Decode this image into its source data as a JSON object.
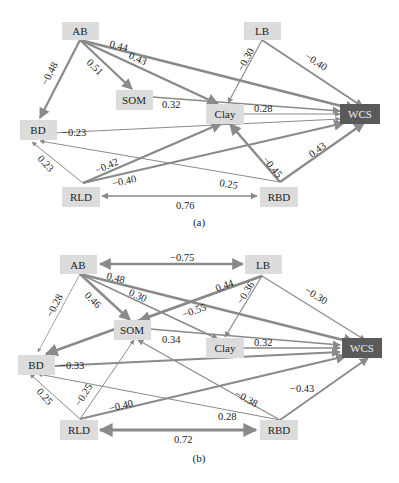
{
  "diagrams": [
    {
      "id": "a",
      "caption": "(a)",
      "nodes": {
        "AB": "AB",
        "LB": "LB",
        "SOM": "SOM",
        "Clay": "Clay",
        "BD": "BD",
        "WCS": "WCS",
        "RLD": "RLD",
        "RBD": "RBD"
      },
      "edges": [
        {
          "from": "AB",
          "to": "WCS",
          "label": "0.44"
        },
        {
          "from": "AB",
          "to": "Clay",
          "label": "0.43"
        },
        {
          "from": "AB",
          "to": "SOM",
          "label": "0.51"
        },
        {
          "from": "AB",
          "to": "BD",
          "label": "-0.48"
        },
        {
          "from": "LB",
          "to": "Clay",
          "label": "-0.30"
        },
        {
          "from": "LB",
          "to": "WCS",
          "label": "-0.40"
        },
        {
          "from": "SOM",
          "to": "WCS",
          "label": "0.32"
        },
        {
          "from": "Clay",
          "to": "WCS",
          "label": "0.28"
        },
        {
          "from": "BD",
          "to": "WCS",
          "label": "-0.23"
        },
        {
          "from": "RLD",
          "to": "BD",
          "label": "0.23"
        },
        {
          "from": "RLD",
          "to": "Clay",
          "label": "-0.42"
        },
        {
          "from": "RLD",
          "to": "WCS",
          "label": "-0.40"
        },
        {
          "from": "RBD",
          "to": "BD",
          "label": "0.25"
        },
        {
          "from": "RBD",
          "to": "Clay",
          "label": "-0.45"
        },
        {
          "from": "RBD",
          "to": "WCS",
          "label": "0.43"
        },
        {
          "from": "RLD",
          "to": "RBD",
          "label": "0.76",
          "bidirectional": true
        }
      ]
    },
    {
      "id": "b",
      "caption": "(b)",
      "nodes": {
        "AB": "AB",
        "LB": "LB",
        "SOM": "SOM",
        "Clay": "Clay",
        "BD": "BD",
        "WCS": "WCS",
        "RLD": "RLD",
        "RBD": "RBD"
      },
      "edges": [
        {
          "from": "AB",
          "to": "LB",
          "label": "-0.75",
          "bidirectional": true
        },
        {
          "from": "AB",
          "to": "WCS",
          "label": "0.48"
        },
        {
          "from": "AB",
          "to": "Clay",
          "label": "0.30"
        },
        {
          "from": "AB",
          "to": "SOM",
          "label": "0.46"
        },
        {
          "from": "AB",
          "to": "BD",
          "label": "-0.28"
        },
        {
          "from": "LB",
          "to": "BD",
          "label": "0.44"
        },
        {
          "from": "LB",
          "to": "SOM",
          "label": "-0.55"
        },
        {
          "from": "LB",
          "to": "Clay",
          "label": "-0.36"
        },
        {
          "from": "LB",
          "to": "WCS",
          "label": "-0.30"
        },
        {
          "from": "SOM",
          "to": "WCS",
          "label": "0.34"
        },
        {
          "from": "Clay",
          "to": "WCS",
          "label": "0.32"
        },
        {
          "from": "BD",
          "to": "WCS",
          "label": "-0.33"
        },
        {
          "from": "RLD",
          "to": "BD",
          "label": "0.25"
        },
        {
          "from": "RLD",
          "to": "SOM",
          "label": "-0.25"
        },
        {
          "from": "RLD",
          "to": "WCS",
          "label": "-0.40"
        },
        {
          "from": "RBD",
          "to": "BD",
          "label": "0.28"
        },
        {
          "from": "RBD",
          "to": "SOM",
          "label": "-0.38"
        },
        {
          "from": "RBD",
          "to": "WCS",
          "label": "-0.43"
        },
        {
          "from": "RLD",
          "to": "RBD",
          "label": "0.72",
          "bidirectional": true
        }
      ]
    }
  ],
  "colors": {
    "node_fill": "#dcdcdc",
    "target_node_fill": "#5a5a5a",
    "edge": "#8a8a8a"
  }
}
